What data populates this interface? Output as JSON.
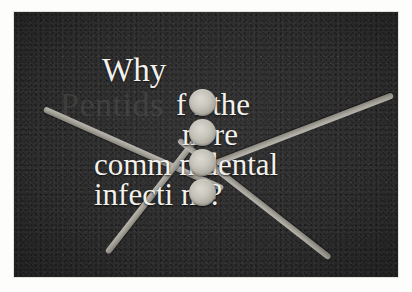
{
  "poster": {
    "brand_ghost_text": "Pentids",
    "headline": {
      "line1": "Why",
      "line2": "f   r the",
      "line3": "m   re",
      "line4": "comm   n dental",
      "line5": "infecti   ns?"
    },
    "full_headline_text": "Why for the more common dental infections?",
    "colors": {
      "plate_background": "#2f2f30",
      "headline_text": "#f3f1ec",
      "ghost_text": "#4a4846",
      "bar_metal": "#a6a39b",
      "tablet_face": "#c2bfb5",
      "paper_margin": "#fdfdfc"
    },
    "elements": {
      "tablet_count": 4,
      "bar_count": 4,
      "tablet_label": "tablet",
      "bar_label": "radiating-bar"
    }
  }
}
